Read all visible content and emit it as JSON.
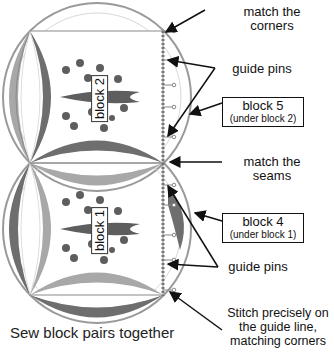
{
  "diagram": {
    "caption": "Sew block pairs together",
    "blocks": [
      {
        "id": "block-2",
        "label": "block 2"
      },
      {
        "id": "block-1",
        "label": "block 1"
      }
    ],
    "callouts": {
      "match_corners": "match the\ncorners",
      "guide_pins_top": "guide pins",
      "block5_title": "block 5",
      "block5_sub": "(under block 2)",
      "match_seams": "match the\nseams",
      "block4_title": "block 4",
      "block4_sub": "(under block 1)",
      "guide_pins_bottom": "guide pins",
      "stitch_note": "Stitch precisely on\nthe guide line,\nmatching corners"
    },
    "colors": {
      "dark_arc": "#6e6e6e",
      "light_arc": "#a8a8a8",
      "outline": "#8a8a8a",
      "motif": "#5e5e5e",
      "stitch_line": "#777777"
    }
  }
}
